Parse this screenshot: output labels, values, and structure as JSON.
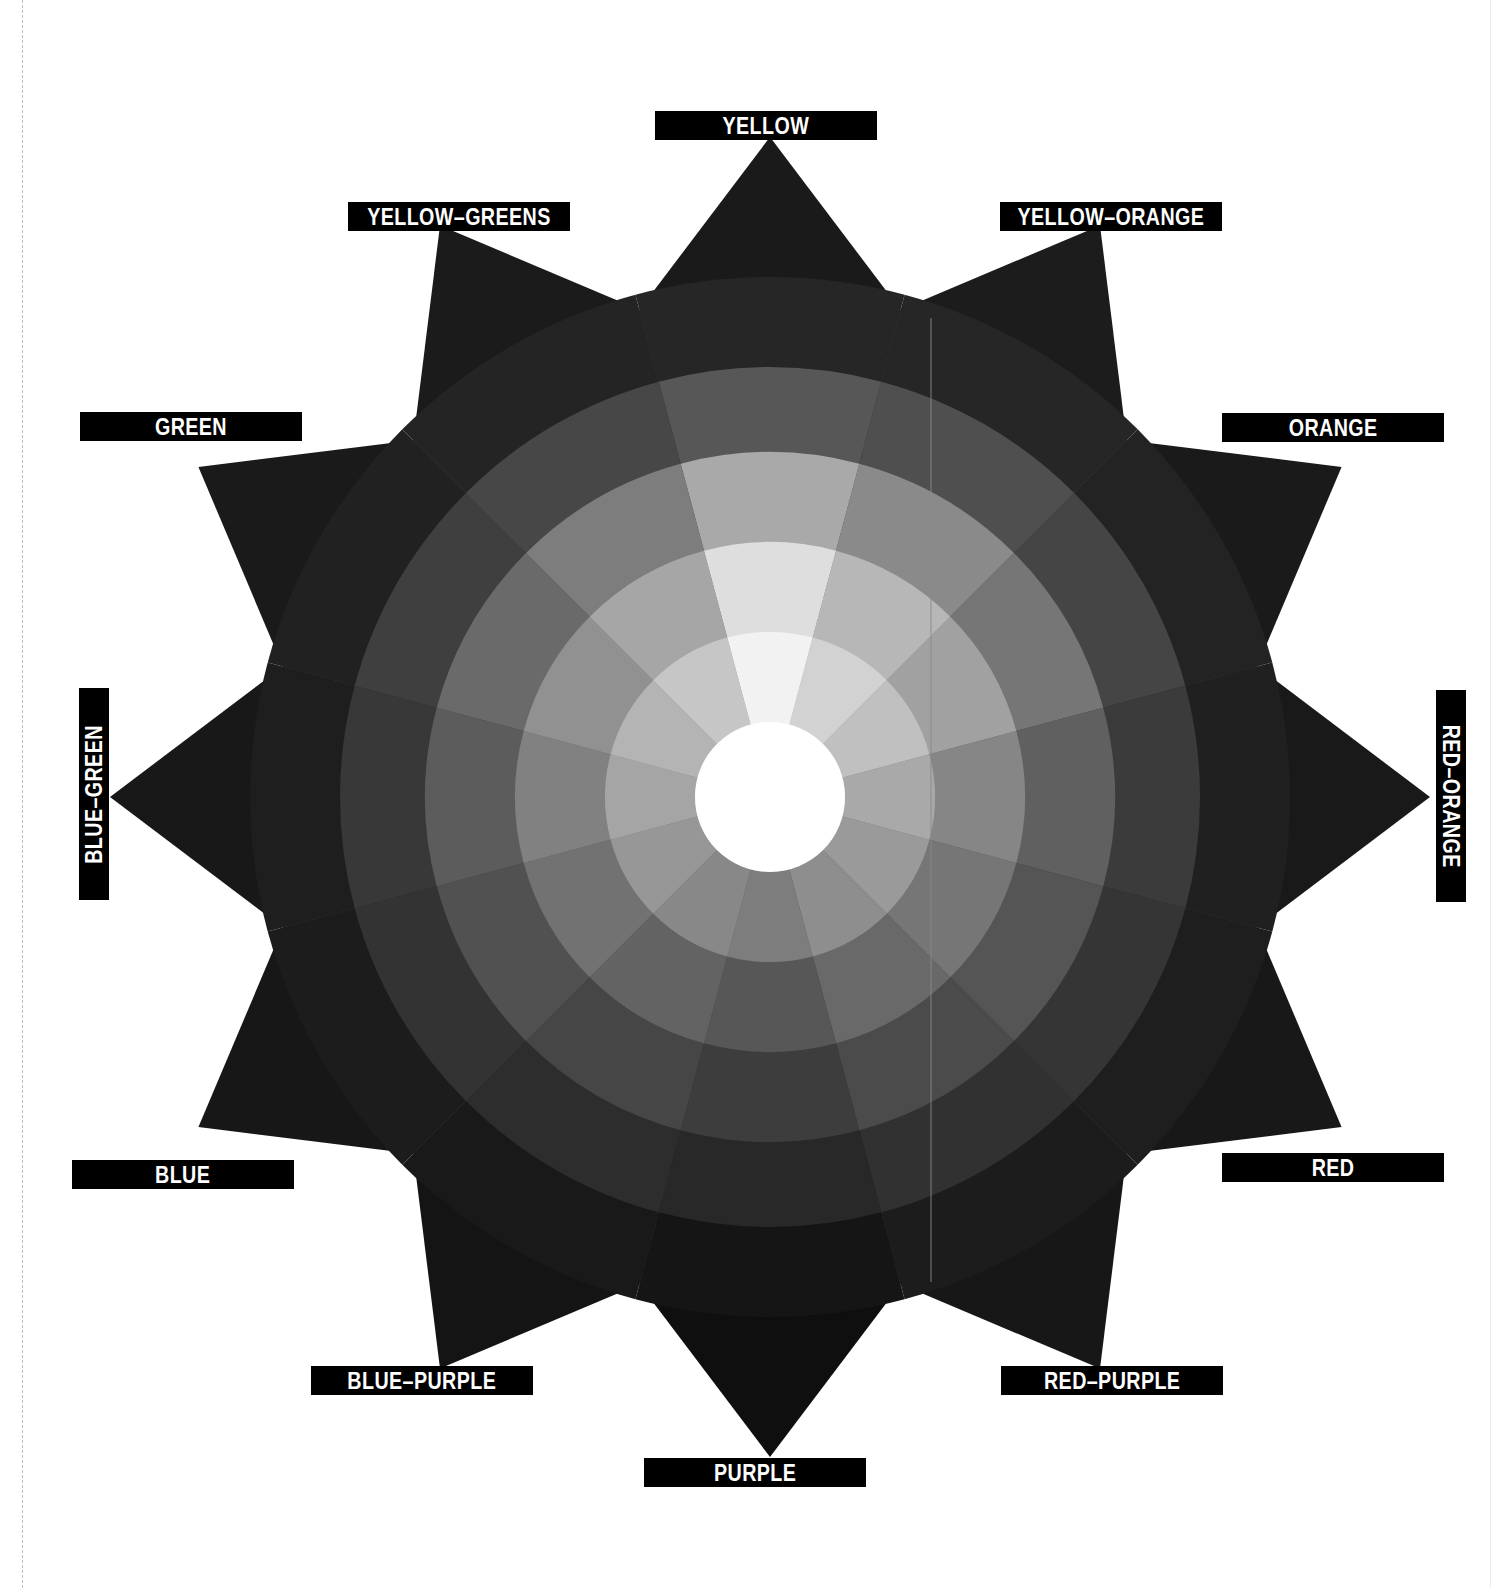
{
  "wheel": {
    "center": [
      770,
      797
    ],
    "outer_star_radius": 660,
    "inner_star_radius": 520,
    "ring_radii": [
      75,
      165,
      255,
      345,
      430,
      520
    ],
    "points": 12,
    "hole_color": "#ffffff",
    "sector_values": [
      0.97,
      0.86,
      0.78,
      0.6,
      0.5,
      0.42,
      0.3,
      0.38,
      0.48,
      0.58,
      0.7,
      0.82
    ],
    "ring_gray_levels": [
      [
        "#fbfbfb",
        "#e6e6e6",
        "#dadada",
        "#c9c9c9",
        "#bdbdbd",
        "#b4b4b4",
        "#a6a6a6",
        "#b0b0b0",
        "#bcbcbc",
        "#c6c6c6",
        "#d1d1d1",
        "#dedede"
      ],
      [
        "#f2f2f2",
        "#d2d2d2",
        "#c0c0c0",
        "#a9a9a9",
        "#9a9a9a",
        "#8e8e8e",
        "#7d7d7d",
        "#888888",
        "#979797",
        "#a5a5a5",
        "#b4b4b4",
        "#c6c6c6"
      ],
      [
        "#dedede",
        "#b7b7b7",
        "#a1a1a1",
        "#868686",
        "#767676",
        "#696969",
        "#575757",
        "#636363",
        "#727272",
        "#818181",
        "#919191",
        "#a6a6a6"
      ],
      [
        "#a9a9a9",
        "#8a8a8a",
        "#767676",
        "#606060",
        "#555555",
        "#4b4b4b",
        "#3d3d3d",
        "#464646",
        "#515151",
        "#5c5c5c",
        "#6a6a6a",
        "#7d7d7d"
      ],
      [
        "#575757",
        "#4f4f4f",
        "#454545",
        "#3b3b3b",
        "#353535",
        "#313131",
        "#282828",
        "#2d2d2d",
        "#333333",
        "#383838",
        "#3f3f3f",
        "#474747"
      ],
      [
        "#262626",
        "#262626",
        "#232323",
        "#202020",
        "#1e1e1e",
        "#1c1c1c",
        "#151515",
        "#191919",
        "#1c1c1c",
        "#1e1e1e",
        "#212121",
        "#242424"
      ]
    ],
    "star_tip_colors": [
      "#1a1a1a",
      "#1c1c1c",
      "#1a1a1a",
      "#191919",
      "#181818",
      "#171717",
      "#0f0f0f",
      "#141414",
      "#171717",
      "#181818",
      "#1a1a1a",
      "#1b1b1b"
    ]
  },
  "labels": [
    {
      "id": "yellow",
      "text": "YELLOW",
      "x": 655,
      "y": 111,
      "w": 222,
      "h": 29,
      "rot": 0
    },
    {
      "id": "yellow-orange",
      "text": "YELLOW–ORANGE",
      "x": 1000,
      "y": 202,
      "w": 222,
      "h": 29,
      "rot": 0
    },
    {
      "id": "orange",
      "text": "ORANGE",
      "x": 1222,
      "y": 413,
      "w": 222,
      "h": 29,
      "rot": 0
    },
    {
      "id": "red-orange",
      "text": "RED–ORANGE",
      "x": 1436,
      "y": 690,
      "w": 30,
      "h": 212,
      "rot": 90
    },
    {
      "id": "red",
      "text": "RED",
      "x": 1222,
      "y": 1153,
      "w": 222,
      "h": 29,
      "rot": 0
    },
    {
      "id": "red-purple",
      "text": "RED–PURPLE",
      "x": 1001,
      "y": 1366,
      "w": 222,
      "h": 29,
      "rot": 0
    },
    {
      "id": "purple",
      "text": "PURPLE",
      "x": 644,
      "y": 1458,
      "w": 222,
      "h": 29,
      "rot": 0
    },
    {
      "id": "blue-purple",
      "text": "BLUE–PURPLE",
      "x": 311,
      "y": 1366,
      "w": 222,
      "h": 29,
      "rot": 0
    },
    {
      "id": "blue",
      "text": "BLUE",
      "x": 72,
      "y": 1160,
      "w": 222,
      "h": 29,
      "rot": 0
    },
    {
      "id": "blue-green",
      "text": "BLUE–GREEN",
      "x": 79,
      "y": 688,
      "w": 30,
      "h": 212,
      "rot": -90
    },
    {
      "id": "green",
      "text": "GREEN",
      "x": 80,
      "y": 412,
      "w": 222,
      "h": 29,
      "rot": 0
    },
    {
      "id": "yellow-greens",
      "text": "YELLOW–GREENS",
      "x": 348,
      "y": 202,
      "w": 222,
      "h": 29,
      "rot": 0
    }
  ],
  "fold_line": {
    "x": 931,
    "y1": 318,
    "y2": 1282,
    "color": "#8a8a8a"
  }
}
